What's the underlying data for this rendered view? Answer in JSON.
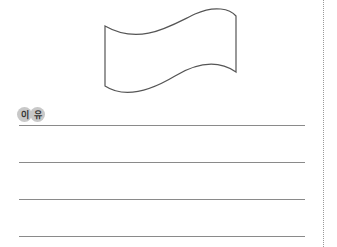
{
  "figure": {
    "icon": "flag-outline-icon"
  },
  "label": {
    "chars": [
      "이",
      "유"
    ]
  },
  "answer_lines": {
    "count": 4
  }
}
